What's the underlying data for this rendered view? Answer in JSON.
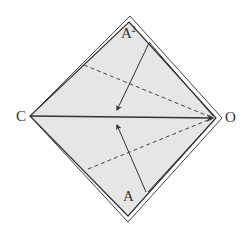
{
  "diagram": {
    "type": "fold-diagram",
    "colors": {
      "fill": "#e6e6e6",
      "stroke": "#333333",
      "dashed": "#444444",
      "background": "#ffffff"
    },
    "labels": {
      "top": "A",
      "top_superscript": "2",
      "left": "C",
      "right": "O",
      "bottom": "A"
    }
  }
}
